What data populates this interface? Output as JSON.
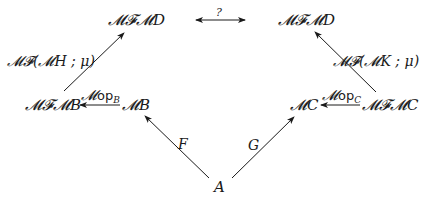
{
  "diagram": {
    "type": "commutative-diagram",
    "nodes": {
      "top_left": "𝓜𝓕𝓜D",
      "top_right": "𝓜𝓕𝓜D",
      "mid_left_outer": "𝓜𝓕𝓜B",
      "mid_left_inner": "𝓜B",
      "mid_right_inner": "𝓜C",
      "mid_right_outer": "𝓜𝓕𝓜C",
      "bottom": "A"
    },
    "edges": {
      "top_question": {
        "label": "?",
        "from": "top_left",
        "to": "top_right",
        "style": "double-headed"
      },
      "left_up": {
        "label": "𝓜𝓕(𝓜H ; μ)",
        "from": "mid_left_outer",
        "to": "top_left"
      },
      "right_up": {
        "label": "𝓜𝓕(𝓜K ; μ)",
        "from": "mid_right_outer",
        "to": "top_right"
      },
      "op_b": {
        "prefix": "𝓜",
        "op": "op",
        "sub": "B",
        "from": "mid_left_inner",
        "to": "mid_left_outer"
      },
      "op_c": {
        "prefix": "𝓜",
        "op": "op",
        "sub": "C",
        "from": "mid_right_outer",
        "to": "mid_right_inner"
      },
      "f": {
        "label": "F",
        "from": "bottom",
        "to": "mid_left_inner"
      },
      "g": {
        "label": "G",
        "from": "bottom",
        "to": "mid_right_inner"
      }
    },
    "colors": {
      "ink": "#1a1a1a",
      "background": "#ffffff"
    }
  }
}
